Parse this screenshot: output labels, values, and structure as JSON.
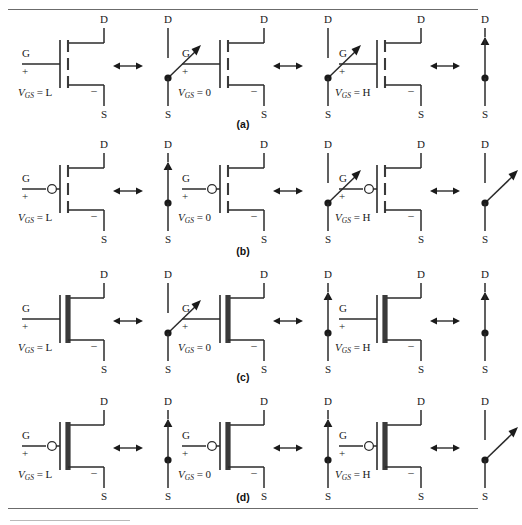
{
  "figure": {
    "terminal_labels": {
      "drain": "D",
      "gate": "G",
      "source": "S",
      "polarity": "+",
      "negative": "–"
    },
    "vgs_symbol": "V",
    "vgs_subscript": "GS",
    "equivalence_symbol": "double-headed-arrow",
    "rows": [
      {
        "id": "a",
        "row_label": "(a)",
        "device": "n-channel enhancement MOSFET",
        "channel_style": "broken",
        "gate_bubble": false,
        "cells": [
          {
            "vgs_value": "L",
            "vgs_text": "= L",
            "switch_state": "open"
          },
          {
            "vgs_value": "0",
            "vgs_text": "= 0",
            "switch_state": "open"
          },
          {
            "vgs_value": "H",
            "vgs_text": "= H",
            "switch_state": "closed"
          }
        ]
      },
      {
        "id": "b",
        "row_label": "(b)",
        "device": "p-channel enhancement MOSFET",
        "channel_style": "broken",
        "gate_bubble": true,
        "cells": [
          {
            "vgs_value": "L",
            "vgs_text": "= L",
            "switch_state": "closed"
          },
          {
            "vgs_value": "0",
            "vgs_text": "= 0",
            "switch_state": "open"
          },
          {
            "vgs_value": "H",
            "vgs_text": "= H",
            "switch_state": "open"
          }
        ]
      },
      {
        "id": "c",
        "row_label": "(c)",
        "device": "n-channel depletion MOSFET",
        "channel_style": "solid",
        "gate_bubble": false,
        "cells": [
          {
            "vgs_value": "L",
            "vgs_text": "= L",
            "switch_state": "open"
          },
          {
            "vgs_value": "0",
            "vgs_text": "= 0",
            "switch_state": "closed"
          },
          {
            "vgs_value": "H",
            "vgs_text": "= H",
            "switch_state": "closed"
          }
        ]
      },
      {
        "id": "d",
        "row_label": "(d)",
        "device": "p-channel depletion MOSFET",
        "channel_style": "solid",
        "gate_bubble": true,
        "cells": [
          {
            "vgs_value": "L",
            "vgs_text": "= L",
            "switch_state": "closed"
          },
          {
            "vgs_value": "0",
            "vgs_text": "= 0",
            "switch_state": "closed"
          },
          {
            "vgs_value": "H",
            "vgs_text": "= H",
            "switch_state": "open"
          }
        ]
      }
    ]
  },
  "colors": {
    "ink": "#1a1a1a",
    "wire": "#2b2b2b",
    "rule": "#6b6b6b",
    "channel": "#3a3a3a"
  }
}
